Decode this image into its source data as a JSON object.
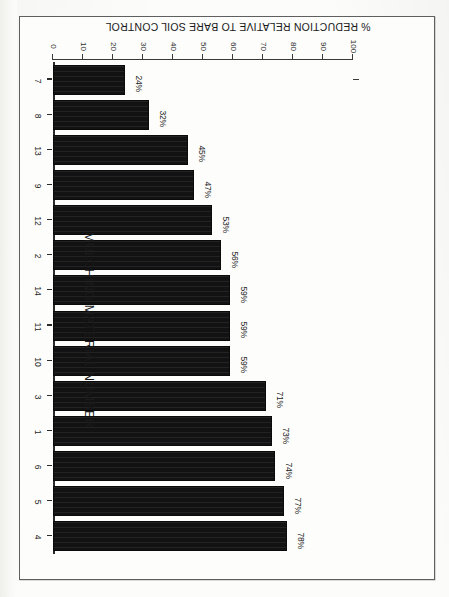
{
  "chart_data": {
    "type": "bar",
    "orientation": "vertical",
    "title": "",
    "xlabel": "MULCHING MATERIAL NUMBER",
    "ylabel": "% REDUCTION RELATIVE TO BARE SOIL CONTROL",
    "categories": [
      "4",
      "5",
      "6",
      "1",
      "3",
      "10",
      "11",
      "14",
      "2",
      "12",
      "9",
      "13",
      "8",
      "7"
    ],
    "values": [
      78,
      77,
      74,
      73,
      71,
      59,
      59,
      59,
      56,
      53,
      47,
      45,
      32,
      24
    ],
    "data_labels": [
      "78%",
      "77%",
      "74%",
      "73%",
      "71%",
      "59%",
      "59%",
      "59%",
      "56%",
      "53%",
      "47%",
      "45%",
      "32%",
      "24%"
    ],
    "ylim": [
      0,
      100
    ],
    "yticks": [
      0,
      10,
      20,
      30,
      40,
      50,
      60,
      70,
      80,
      90,
      100
    ],
    "ytick_labels": [
      "0",
      "10",
      "20",
      "30",
      "40",
      "50",
      "60",
      "70",
      "80",
      "90",
      "100"
    ],
    "grid": false,
    "legend": null,
    "bar_color": "#121212",
    "page_rotation_degrees": 180
  },
  "figure": {
    "border_color": "#5f5f5f",
    "background_color": "#fdfdfc"
  }
}
